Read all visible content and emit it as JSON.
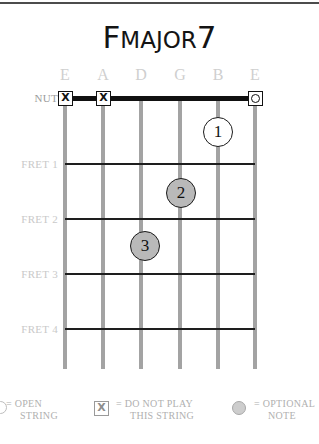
{
  "title": {
    "lead": "F",
    "mid": "MAJOR",
    "tail": "7",
    "full": "Fmajor7"
  },
  "fretboard": {
    "nut_label": "NUT",
    "string_names": [
      "E",
      "A",
      "D",
      "G",
      "B",
      "E"
    ],
    "fret_labels": [
      "FRET 1",
      "FRET 2",
      "FRET 3",
      "FRET 4"
    ],
    "nut_markers": [
      {
        "string": 1,
        "symbol": "X",
        "name": "do-not-play"
      },
      {
        "string": 2,
        "symbol": "X",
        "name": "do-not-play"
      },
      {
        "string": 6,
        "symbol": "O",
        "name": "open-string"
      }
    ],
    "fingerings": [
      {
        "finger": "1",
        "string": 5,
        "fret": 1,
        "fill": "white"
      },
      {
        "finger": "2",
        "string": 4,
        "fret": 2,
        "fill": "gray"
      },
      {
        "finger": "3",
        "string": 3,
        "fret": 3,
        "fill": "gray"
      }
    ]
  },
  "legend": [
    {
      "symbol": "O",
      "line1": "= OPEN",
      "line2": "STRING",
      "name": "open-string"
    },
    {
      "symbol": "X",
      "line1": "= DO NOT PLAY",
      "line2": "THIS STRING",
      "name": "do-not-play"
    },
    {
      "symbol": "●",
      "line1": "= OPTIONAL",
      "line2": "NOTE",
      "name": "optional-note"
    }
  ],
  "colors": {
    "ink": "#121212",
    "string": "#a3a3a3",
    "label": "#c9c9c9",
    "dot_gray": "#b9b9b9"
  }
}
